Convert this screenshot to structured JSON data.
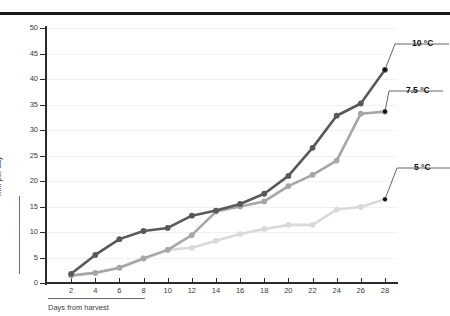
{
  "chart_data": {
    "type": "line",
    "title": "",
    "xlabel": "Days from harvest",
    "ylabel": "mm per day",
    "xlim": [
      0,
      29
    ],
    "ylim": [
      0,
      50
    ],
    "grid": true,
    "legend_position": "right-inline-labels",
    "x": [
      2,
      4,
      6,
      8,
      10,
      12,
      14,
      16,
      18,
      20,
      22,
      24,
      26,
      28
    ],
    "xticks": [
      "2",
      "4",
      "6",
      "8",
      "10",
      "12",
      "14",
      "16",
      "18",
      "20",
      "22",
      "24",
      "26",
      "28"
    ],
    "yticks": [
      "0",
      "5",
      "10",
      "15",
      "20",
      "25",
      "30",
      "35",
      "40",
      "45",
      "50"
    ],
    "series": [
      {
        "name": "10 °C",
        "color": "#595959",
        "values": [
          1.8,
          5.5,
          8.6,
          10.2,
          10.8,
          13.2,
          14.2,
          15.5,
          17.5,
          21.0,
          26.5,
          32.8,
          35.2,
          41.8
        ]
      },
      {
        "name": "7.5 °C",
        "color": "#a6a6a6",
        "values": [
          1.5,
          2.0,
          3.0,
          4.8,
          6.5,
          9.4,
          14.0,
          15.0,
          16.0,
          19.0,
          21.2,
          24.0,
          33.2,
          33.6
        ]
      },
      {
        "name": "5 °C",
        "color": "#d9d9d9",
        "values": [
          1.4,
          1.9,
          3.0,
          4.8,
          6.5,
          6.9,
          8.3,
          9.6,
          10.6,
          11.4,
          11.4,
          14.4,
          14.9,
          16.4
        ]
      }
    ]
  },
  "colors": {
    "axis": "#2b2b2b",
    "grid": "#eef2f7",
    "rule": "#1a1a1a",
    "text": "#3a3a3a",
    "leader": "#555555"
  },
  "labels": {
    "series_10": "10 °C",
    "series_75": "7.5 °C",
    "series_5": "5 °C"
  }
}
